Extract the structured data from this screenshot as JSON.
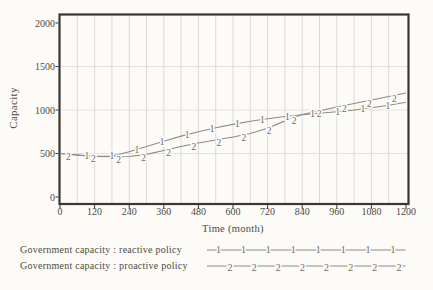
{
  "chart_data": {
    "type": "line",
    "title": "",
    "xlabel": "Time (month)",
    "ylabel": "Capacity",
    "xlim": [
      0,
      1200
    ],
    "ylim": [
      0,
      2000
    ],
    "x_ticks": [
      0,
      120,
      240,
      360,
      480,
      600,
      720,
      840,
      960,
      1080,
      1200
    ],
    "y_ticks": [
      0,
      500,
      1000,
      1500,
      2000
    ],
    "grid": true,
    "minor_vertical_grid_step_months": 60,
    "legend_position": "bottom-left",
    "x": [
      0,
      60,
      120,
      180,
      240,
      300,
      360,
      420,
      480,
      540,
      600,
      660,
      720,
      780,
      840,
      900,
      960,
      1020,
      1080,
      1140,
      1200
    ],
    "series": [
      {
        "name": "Government capacity : reactive policy",
        "marker_digit": "1",
        "values": [
          500,
          480,
          467,
          470,
          520,
          580,
          640,
          700,
          750,
          795,
          835,
          870,
          900,
          925,
          945,
          962,
          980,
          1000,
          1025,
          1055,
          1090
        ],
        "marker_months": [
          93,
          180,
          267,
          354,
          441,
          528,
          615,
          702,
          789,
          876,
          963,
          1050,
          1137
        ]
      },
      {
        "name": "Government capacity : proactive policy",
        "marker_digit": "2",
        "values": [
          500,
          485,
          467,
          462,
          465,
          490,
          535,
          580,
          620,
          655,
          690,
          730,
          790,
          875,
          948,
          992,
          1035,
          1075,
          1115,
          1155,
          1195
        ],
        "marker_months": [
          29,
          116,
          203,
          290,
          377,
          464,
          551,
          638,
          725,
          812,
          899,
          986,
          1073,
          1160
        ]
      }
    ]
  },
  "legend": {
    "rows": [
      {
        "label": "Government capacity : reactive policy",
        "digit": "1",
        "digit_count": 8
      },
      {
        "label": "Government capacity : proactive policy",
        "digit": "2",
        "digit_count": 8
      }
    ]
  },
  "colors": {
    "background": "#fcfbf8",
    "frame": "#3a372f",
    "grid_vertical": "#dcdad6",
    "grid_horizontal": "#e4e2de",
    "curve": "#8d8b87",
    "marker_digit": "#6d6a64",
    "text": "#4e4a43"
  }
}
